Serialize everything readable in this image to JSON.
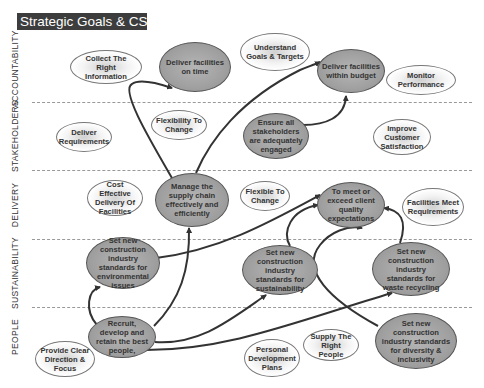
{
  "title": "Strategic Goals & CSF's",
  "lanes": [
    {
      "label": "ACCOUNTABILITY"
    },
    {
      "label": "STAKEHOLDERS"
    },
    {
      "label": "DELIVERY"
    },
    {
      "label": "SUSTAINABILITY"
    },
    {
      "label": "PEOPLE"
    }
  ],
  "nodes": {
    "collect_info": {
      "text": "Collect The Right Information",
      "style": "csf"
    },
    "deliver_on_time": {
      "text": "Deliver facilities on time",
      "style": "goal"
    },
    "understand_goals": {
      "text": "Understand Goals & Targets",
      "style": "csf"
    },
    "deliver_budget": {
      "text": "Deliver facilities within budget",
      "style": "goal"
    },
    "monitor_perf": {
      "text": "Monitor Performance",
      "style": "csf"
    },
    "deliver_requirements": {
      "text": "Deliver Requirements",
      "style": "csf"
    },
    "flexibility_change": {
      "text": "Flexibility To Change",
      "style": "csf"
    },
    "ensure_stakeholders": {
      "text": "Ensure all stakeholders are adequately engaged",
      "style": "goal"
    },
    "improve_customer": {
      "text": "Improve Customer Satisfaction",
      "style": "csf"
    },
    "cost_effective": {
      "text": "Cost Effective Delivery Of Facilities",
      "style": "csf"
    },
    "manage_supply": {
      "text": "Manage the supply chain effectively and efficiently",
      "style": "goal"
    },
    "flexible_change": {
      "text": "Flexible To Change",
      "style": "csf"
    },
    "meet_quality": {
      "text": "To meet or exceed client quality expectations",
      "style": "goal"
    },
    "facilities_meet": {
      "text": "Facilities Meet Requirements",
      "style": "csf"
    },
    "std_environmental": {
      "text": "Set new construction industry standards for environmental issues",
      "style": "goal"
    },
    "std_sustainability": {
      "text": "Set new construction industry standards for sustainability",
      "style": "goal"
    },
    "std_waste": {
      "text": "Set new construction industry standards for waste recycling",
      "style": "goal"
    },
    "recruit": {
      "text": "Recruit, develop and retain the best people,",
      "style": "goal"
    },
    "provide_direction": {
      "text": "Provide Clear Direction & Focus",
      "style": "csf"
    },
    "personal_dev": {
      "text": "Personal Development Plans",
      "style": "csf"
    },
    "supply_people": {
      "text": "Supply The Right People",
      "style": "csf"
    },
    "std_diversity": {
      "text": "Set new construction industry standards for diversity & inclusivity",
      "style": "goal"
    }
  },
  "edges": [
    {
      "from": "manage_supply",
      "to": "deliver_on_time"
    },
    {
      "from": "manage_supply",
      "to": "deliver_budget"
    },
    {
      "from": "ensure_stakeholders",
      "to": "deliver_budget"
    },
    {
      "from": "std_environmental",
      "to": "meet_quality"
    },
    {
      "from": "std_sustainability",
      "to": "meet_quality"
    },
    {
      "from": "std_diversity",
      "to": "meet_quality"
    },
    {
      "from": "std_waste",
      "to": "meet_quality"
    },
    {
      "from": "recruit",
      "to": "manage_supply"
    },
    {
      "from": "recruit",
      "to": "std_environmental"
    },
    {
      "from": "recruit",
      "to": "std_sustainability"
    },
    {
      "from": "recruit",
      "to": "std_waste"
    },
    {
      "from": "recruit",
      "to": "meet_quality"
    }
  ],
  "colors": {
    "title_bg": "#3d3d3d",
    "goal_fill": "#a0a0a0",
    "csf_fill": "#ffffff",
    "arrow": "#333333",
    "divider": "#999999"
  }
}
